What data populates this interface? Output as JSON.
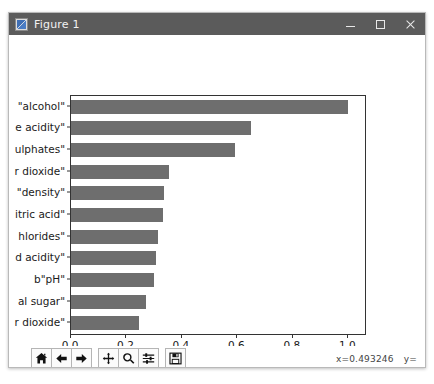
{
  "window": {
    "title": "Figure 1",
    "icon": "matplotlib-figure-icon",
    "minimize_label": "–",
    "maximize_label": "□",
    "close_label": "×"
  },
  "toolbar": {
    "buttons": [
      {
        "name": "home-button",
        "label": "Home",
        "icon": "home-icon"
      },
      {
        "name": "back-button",
        "label": "Back",
        "icon": "arrow-left-icon"
      },
      {
        "name": "forward-button",
        "label": "Forward",
        "icon": "arrow-right-icon"
      },
      {
        "name": "pan-button",
        "label": "Pan",
        "icon": "move-cross-icon"
      },
      {
        "name": "zoom-button",
        "label": "Zoom",
        "icon": "magnifier-icon"
      },
      {
        "name": "configure-button",
        "label": "Configure subplots",
        "icon": "sliders-icon"
      },
      {
        "name": "save-button",
        "label": "Save",
        "icon": "floppy-disk-icon"
      }
    ],
    "status": {
      "x": "x=0.493246",
      "y": "y="
    }
  },
  "chart_data": {
    "type": "bar",
    "orientation": "horizontal",
    "title": "",
    "xlabel": "variable importance",
    "ylabel": "",
    "xlim": [
      0.0,
      1.06
    ],
    "xticks": [
      0.0,
      0.2,
      0.4,
      0.6,
      0.8,
      1.0
    ],
    "xticklabels": [
      "0.0",
      "0.2",
      "0.4",
      "0.6",
      "0.8",
      "1.0"
    ],
    "grid": false,
    "legend": null,
    "bar_color": "#6e6e6e",
    "categories": [
      "\"alcohol\"",
      "e acidity\"",
      "ulphates\"",
      "r dioxide\"",
      "\"density\"",
      "itric acid\"",
      "hlorides\"",
      "d acidity\"",
      "b\"pH\"",
      "al sugar\"",
      "r dioxide\""
    ],
    "values": [
      1.0,
      0.65,
      0.59,
      0.355,
      0.335,
      0.33,
      0.315,
      0.305,
      0.3,
      0.27,
      0.245
    ]
  }
}
